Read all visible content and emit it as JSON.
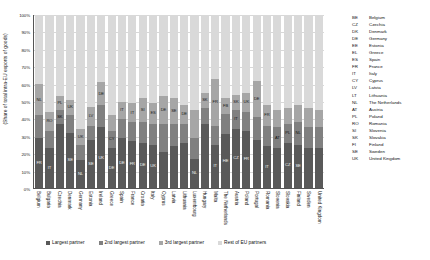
{
  "chart_data": {
    "type": "bar",
    "subtype": "stacked-bar-100",
    "title": "",
    "xlabel": "",
    "ylabel": "(Share of total intra-EU exports of goods)",
    "ylim": [
      0,
      100
    ],
    "grid": true,
    "legend_position": "bottom",
    "ytick_labels": [
      "100%",
      "90%",
      "80%",
      "70%",
      "60%",
      "50%",
      "40%",
      "30%",
      "20%",
      "10%",
      "0%"
    ],
    "series": [
      {
        "name": "Largest partner",
        "key": "s1",
        "color": "#595959"
      },
      {
        "name": "2nd largest partner",
        "key": "s2",
        "color": "#808080"
      },
      {
        "name": "3rd largest partner",
        "key": "s3",
        "color": "#a6a6a6"
      },
      {
        "name": "Rest of EU partners",
        "key": "s4",
        "color": "#d9d9d9"
      }
    ],
    "categories": [
      "Belgium",
      "Bulgaria",
      "Czechia",
      "Denmark",
      "Germany",
      "Estonia",
      "Ireland",
      "Greece",
      "Spain",
      "France",
      "Croatia",
      "Italy",
      "Cyprus",
      "Latvia",
      "Lithuania",
      "Luxembourg",
      "Hungary",
      "Malta",
      "The Netherlands",
      "Austria",
      "Poland",
      "Portugal",
      "Romania",
      "Slovenia",
      "Slovakia",
      "Finland",
      "Sweden",
      "United Kingdom"
    ],
    "bars": [
      {
        "country": "Belgium",
        "s1": 29,
        "s1_lab": "FR",
        "s2": 13,
        "s2_lab": "",
        "s3": 18,
        "s3_lab": "NL",
        "s4": 40
      },
      {
        "country": "Bulgaria",
        "s1": 23,
        "s1_lab": "IT",
        "s2": 10,
        "s2_lab": "",
        "s3": 11,
        "s3_lab": "RO",
        "s4": 56
      },
      {
        "country": "Czechia",
        "s1": 37,
        "s1_lab": "",
        "s2": 8,
        "s2_lab": "SK",
        "s3": 8,
        "s3_lab": "PL",
        "s4": 47
      },
      {
        "country": "Denmark",
        "s1": 32,
        "s1_lab": "SE",
        "s2": 10,
        "s2_lab": "",
        "s3": 9,
        "s3_lab": "UK",
        "s4": 49
      },
      {
        "country": "Germany",
        "s1": 16,
        "s1_lab": "NL",
        "s2": 9,
        "s2_lab": "",
        "s3": 9,
        "s3_lab": "UK",
        "s4": 66
      },
      {
        "country": "Estonia",
        "s1": 28,
        "s1_lab": "SE",
        "s2": 8,
        "s2_lab": "",
        "s3": 11,
        "s3_lab": "LV",
        "s4": 53
      },
      {
        "country": "Ireland",
        "s1": 35,
        "s1_lab": "UK",
        "s2": 13,
        "s2_lab": "",
        "s3": 13,
        "s3_lab": "DE",
        "s4": 39
      },
      {
        "country": "Greece",
        "s1": 23,
        "s1_lab": "DE",
        "s2": 10,
        "s2_lab": "CY",
        "s3": 9,
        "s3_lab": "",
        "s4": 58
      },
      {
        "country": "Spain",
        "s1": 29,
        "s1_lab": "DE",
        "s2": 11,
        "s2_lab": "",
        "s3": 10,
        "s3_lab": "IT",
        "s4": 50
      },
      {
        "country": "France",
        "s1": 27,
        "s1_lab": "FR",
        "s2": 11,
        "s2_lab": "",
        "s3": 11,
        "s3_lab": "IT",
        "s4": 51
      },
      {
        "country": "Croatia",
        "s1": 26,
        "s1_lab": "DE",
        "s2": 12,
        "s2_lab": "",
        "s3": 14,
        "s3_lab": "SI",
        "s4": 48
      },
      {
        "country": "Italy",
        "s1": 25,
        "s1_lab": "UK",
        "s2": 12,
        "s2_lab": "",
        "s3": 12,
        "s3_lab": "ES",
        "s4": 51
      },
      {
        "country": "Cyprus",
        "s1": 21,
        "s1_lab": "",
        "s2": 16,
        "s2_lab": "",
        "s3": 16,
        "s3_lab": "DE",
        "s4": 47
      },
      {
        "country": "Latvia",
        "s1": 24,
        "s1_lab": "",
        "s2": 13,
        "s2_lab": "",
        "s3": 15,
        "s3_lab": "SE",
        "s4": 48
      },
      {
        "country": "Lithuania",
        "s1": 26,
        "s1_lab": "",
        "s2": 11,
        "s2_lab": "",
        "s3": 11,
        "s3_lab": "DE",
        "s4": 52
      },
      {
        "country": "Luxembourg",
        "s1": 17,
        "s1_lab": "NL",
        "s2": 12,
        "s2_lab": "",
        "s3": 16,
        "s3_lab": "",
        "s4": 55
      },
      {
        "country": "Hungary",
        "s1": 37,
        "s1_lab": "",
        "s2": 9,
        "s2_lab": "",
        "s3": 9,
        "s3_lab": "SK",
        "s4": 45
      },
      {
        "country": "Malta",
        "s1": 25,
        "s1_lab": "IT",
        "s2": 11,
        "s2_lab": "",
        "s3": 27,
        "s3_lab": "FR",
        "s4": 37
      },
      {
        "country": "The Netherlands",
        "s1": 31,
        "s1_lab": "HE",
        "s2": 12,
        "s2_lab": "",
        "s3": 9,
        "s3_lab": "FB",
        "s4": 48
      },
      {
        "country": "Austria",
        "s1": 34,
        "s1_lab": "CZ",
        "s2": 11,
        "s2_lab": "IT",
        "s3": 9,
        "s3_lab": "SK",
        "s4": 46
      },
      {
        "country": "Poland",
        "s1": 33,
        "s1_lab": "FR",
        "s2": 11,
        "s2_lab": "",
        "s3": 11,
        "s3_lab": "UK",
        "s4": 45
      },
      {
        "country": "Portugal",
        "s1": 28,
        "s1_lab": "",
        "s2": 13,
        "s2_lab": "",
        "s3": 21,
        "s3_lab": "DE",
        "s4": 38
      },
      {
        "country": "Romania",
        "s1": 24,
        "s1_lab": "IT",
        "s2": 12,
        "s2_lab": "",
        "s3": 12,
        "s3_lab": "FR",
        "s4": 52
      },
      {
        "country": "Slovenia",
        "s1": 23,
        "s1_lab": "",
        "s2": 12,
        "s2_lab": "AT",
        "s3": 10,
        "s3_lab": "",
        "s4": 55
      },
      {
        "country": "Slovakia",
        "s1": 26,
        "s1_lab": "CZ",
        "s2": 11,
        "s2_lab": "PL",
        "s3": 9,
        "s3_lab": "",
        "s4": 54
      },
      {
        "country": "Finland",
        "s1": 25,
        "s1_lab": "SE",
        "s2": 13,
        "s2_lab": "NL",
        "s3": 10,
        "s3_lab": "",
        "s4": 52
      },
      {
        "country": "Sweden",
        "s1": 23,
        "s1_lab": "",
        "s2": 12,
        "s2_lab": "",
        "s3": 11,
        "s3_lab": "",
        "s4": 54
      },
      {
        "country": "United Kingdom",
        "s1": 23,
        "s1_lab": "",
        "s2": 12,
        "s2_lab": "",
        "s3": 10,
        "s3_lab": "",
        "s4": 55
      }
    ]
  },
  "country_key": [
    {
      "code": "BE",
      "name": "Belgium"
    },
    {
      "code": "CZ",
      "name": "Czechia"
    },
    {
      "code": "DK",
      "name": "Denmark"
    },
    {
      "code": "DE",
      "name": "Germany"
    },
    {
      "code": "EE",
      "name": "Estonia"
    },
    {
      "code": "EL",
      "name": "Greece"
    },
    {
      "code": "ES",
      "name": "Spain"
    },
    {
      "code": "FR",
      "name": "France"
    },
    {
      "code": "IT",
      "name": "Italy"
    },
    {
      "code": "CY",
      "name": "Cyprus"
    },
    {
      "code": "LV",
      "name": "Latvia"
    },
    {
      "code": "LT",
      "name": "Lithuania"
    },
    {
      "code": "NL",
      "name": "The Netherlands"
    },
    {
      "code": "AT",
      "name": "Austria"
    },
    {
      "code": "PL",
      "name": "Poland"
    },
    {
      "code": "RO",
      "name": "Romania"
    },
    {
      "code": "SI",
      "name": "Slovenia"
    },
    {
      "code": "SK",
      "name": "Slovakia"
    },
    {
      "code": "FI",
      "name": "Finland"
    },
    {
      "code": "SE",
      "name": "Sweden"
    },
    {
      "code": "UK",
      "name": "United Kingdom"
    }
  ]
}
